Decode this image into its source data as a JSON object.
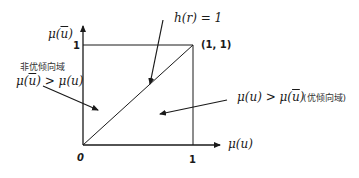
{
  "axes": {
    "y_label_prefix": "μ(",
    "y_label_var": "u",
    "y_label_suffix": ")",
    "x_label": "μ(u)",
    "origin_label": "0",
    "x_tick_1": "1",
    "y_tick_1": "1",
    "corner_label": "(1, 1)"
  },
  "annotations": {
    "diagonal_label": "h(r) = 1",
    "left_region_title": "非优倾向域",
    "left_region_ineq_a": "μ(",
    "left_region_ineq_bar": "u",
    "left_region_ineq_b": ") > μ(u)",
    "right_region_ineq_a": "μ(u) > μ(",
    "right_region_ineq_bar": "u",
    "right_region_ineq_b": ")",
    "right_region_title": "(优倾向域)"
  },
  "colors": {
    "line": "#1a1a1a",
    "background": "#ffffff"
  }
}
